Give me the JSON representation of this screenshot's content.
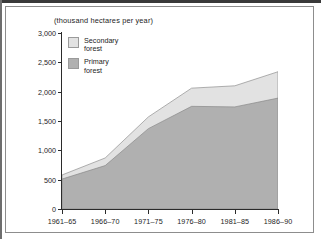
{
  "chart_data": {
    "type": "area",
    "stacked": true,
    "title": "(thousand hectares per year)",
    "xlabel": "",
    "ylabel": "",
    "categories": [
      "1961–65",
      "1966–70",
      "1971–75",
      "1976–80",
      "1981–85",
      "1986–90"
    ],
    "series": [
      {
        "name": "Primary forest",
        "color": "#b0b0b0",
        "values": [
          510,
          740,
          1370,
          1750,
          1740,
          1890
        ]
      },
      {
        "name": "Secondary forest",
        "color": "#e2e2e2",
        "values": [
          70,
          130,
          200,
          310,
          360,
          450
        ]
      }
    ],
    "totals": [
      580,
      870,
      1570,
      2060,
      2100,
      2340
    ],
    "ylim": [
      0,
      3000
    ],
    "yticks": [
      0,
      500,
      1000,
      1500,
      2000,
      2500,
      3000
    ],
    "ytick_labels": [
      "0",
      "500",
      "1,000",
      "1,500",
      "2,000",
      "2,500",
      "3,000"
    ],
    "grid": false,
    "legend_position": "upper-left"
  },
  "legend": {
    "entries": [
      {
        "label": "Secondary\nforest",
        "color": "#e2e2e2"
      },
      {
        "label": "Primary\nforest",
        "color": "#b0b0b0"
      }
    ]
  },
  "colors": {
    "primary_forest": "#b0b0b0",
    "secondary_forest": "#e2e2e2",
    "axis": "#2b2b2b",
    "frame": "#8d8d8d",
    "text": "#1d1d1d"
  }
}
